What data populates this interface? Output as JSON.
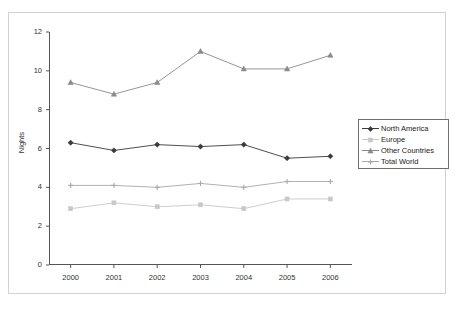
{
  "chart_data": {
    "type": "line",
    "title": "",
    "xlabel": "",
    "ylabel": "Nights",
    "categories": [
      "2000",
      "2001",
      "2002",
      "2003",
      "2004",
      "2005",
      "2006"
    ],
    "x": [
      2000,
      2001,
      2002,
      2003,
      2004,
      2005,
      2006
    ],
    "ylim": [
      0,
      12
    ],
    "yticks": [
      0,
      2,
      4,
      6,
      8,
      10,
      12
    ],
    "ytick_labels": [
      "0",
      "2",
      "4",
      "6",
      "8",
      "10",
      "12"
    ],
    "grid": false,
    "legend_position": "right",
    "series": [
      {
        "name": "North America",
        "color": "#3a3a3a",
        "marker": "diamond",
        "values": [
          6.3,
          5.9,
          6.2,
          6.1,
          6.2,
          5.5,
          5.6
        ]
      },
      {
        "name": "Europe",
        "color": "#c8c8c8",
        "marker": "square",
        "values": [
          2.9,
          3.2,
          3.0,
          3.1,
          2.9,
          3.4,
          3.4
        ]
      },
      {
        "name": "Other Countries",
        "color": "#8a8a8a",
        "marker": "triangle",
        "values": [
          9.4,
          8.8,
          9.4,
          11.0,
          10.1,
          10.1,
          10.8
        ]
      },
      {
        "name": "Total World",
        "color": "#a8a8a8",
        "marker": "cross",
        "values": [
          4.1,
          4.1,
          4.0,
          4.2,
          4.0,
          4.3,
          4.3
        ]
      }
    ]
  },
  "legend": {
    "entries": [
      {
        "label": "North America"
      },
      {
        "label": "Europe"
      },
      {
        "label": "Other Countries"
      },
      {
        "label": "Total World"
      }
    ]
  },
  "axes": {
    "y_title": "Nights"
  }
}
